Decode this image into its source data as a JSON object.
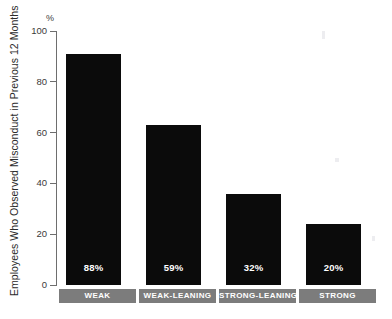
{
  "title_fragment": "",
  "chart_data": {
    "type": "bar",
    "title": "",
    "xlabel": "",
    "ylabel": "Employees Who Observed Misconduct in Previous 12 Months",
    "yunit": "%",
    "ylim": [
      0,
      100
    ],
    "ytick_values": [
      0,
      20,
      40,
      60,
      80,
      100
    ],
    "ytick_labels": [
      "0",
      "20",
      "40",
      "60",
      "80",
      "100"
    ],
    "grid": false,
    "legend": null,
    "bar_color": "#0b0b0b",
    "category_box_color": "#7c7c7c",
    "value_label_color": "#ffffff",
    "categories": [
      "WEAK",
      "WEAK-LEANING",
      "STRONG-LEANING",
      "STRONG"
    ],
    "values": [
      88,
      59,
      32,
      20
    ],
    "bar_plotted_heights": [
      91,
      63,
      36,
      24
    ],
    "data_labels": [
      "88%",
      "59%",
      "32%",
      "20%"
    ]
  }
}
